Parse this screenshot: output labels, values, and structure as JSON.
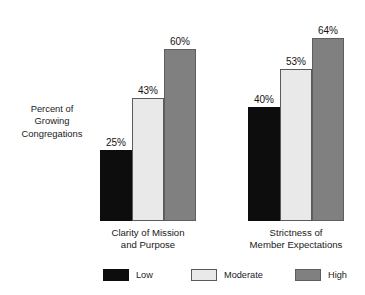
{
  "chart_data": {
    "type": "bar",
    "title": "",
    "subtitle": "",
    "xlabel": "",
    "ylabel": "Percent of Growing Congregations",
    "ylabel_lines": [
      "Percent of",
      "Growing",
      "Congregations"
    ],
    "categories": [
      "Clarity of Mission and Purpose",
      "Strictness of Member Expectations"
    ],
    "category_lines": [
      [
        "Clarity of Mission",
        "and Purpose"
      ],
      [
        "Strictness of",
        "Member Expectations"
      ]
    ],
    "series": [
      {
        "name": "Low",
        "color": "#0d0d0d",
        "values": [
          25,
          40
        ],
        "labels": [
          "25%",
          "40%"
        ]
      },
      {
        "name": "Moderate",
        "color": "#e9e9e9",
        "values": [
          43,
          53
        ],
        "labels": [
          "43%",
          "53%"
        ]
      },
      {
        "name": "High",
        "color": "#808080",
        "values": [
          60,
          64
        ],
        "labels": [
          "64%",
          "64%"
        ]
      }
    ],
    "value_labels": [
      [
        "25%",
        "43%",
        "60%"
      ],
      [
        "40%",
        "53%",
        "64%"
      ]
    ],
    "ylim": [
      0,
      72
    ],
    "grid": false,
    "axis_ticks_visible": false,
    "legend": {
      "position": "bottom",
      "entries": [
        {
          "label": "Low",
          "color": "#0d0d0d"
        },
        {
          "label": "Moderate",
          "color": "#e9e9e9"
        },
        {
          "label": "High",
          "color": "#808080"
        }
      ]
    },
    "units": "percent",
    "background_color": "#ffffff",
    "text_color": "#1a1a1a"
  }
}
